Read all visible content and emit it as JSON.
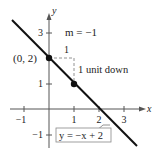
{
  "diagram": {
    "type": "line-graph",
    "equation_label": "y = −x + 2",
    "slope_label": "m = −1",
    "point_label": "(0, 2)",
    "run_label": "1",
    "rise_label": "1 unit down",
    "axis_x_label": "x",
    "axis_y_label": "y",
    "x_ticks": [
      "−1",
      "1",
      "2",
      "3"
    ],
    "y_ticks": [
      "3",
      "1",
      "−1"
    ],
    "points": [
      [
        0,
        2
      ],
      [
        1,
        1
      ]
    ],
    "line": {
      "slope": -1,
      "intercept": 2
    },
    "colors": {
      "line": "#111111",
      "axis": "#555555",
      "dashed": "#777777"
    }
  }
}
